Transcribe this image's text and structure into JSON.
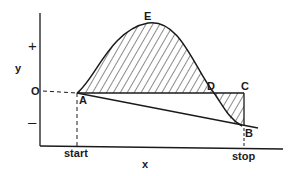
{
  "diagram": {
    "axes": {
      "x_label": "x",
      "y_label": "y",
      "y_plus": "+",
      "y_zero": "O",
      "y_minus": "–"
    },
    "markers": {
      "start": "start",
      "stop": "stop"
    },
    "points": {
      "A": "A",
      "B": "B",
      "C": "C",
      "D": "D",
      "E": "E"
    },
    "colors": {
      "ink": "#1a1a1a",
      "background": "#ffffff"
    }
  }
}
